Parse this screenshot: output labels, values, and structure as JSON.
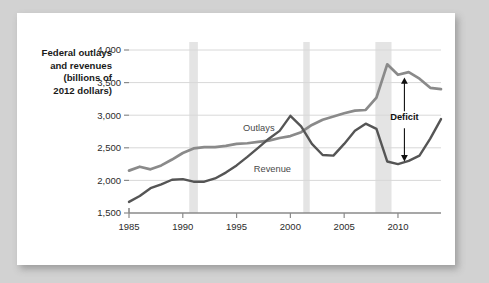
{
  "figure": {
    "y_axis_title_lines": [
      "Federal outlays",
      "and revenues",
      "(billions of",
      "2012 dollars)"
    ],
    "series_label_outlays": "Outlays",
    "series_label_revenue": "Revenue",
    "annotation_deficit": "Deficit",
    "colors": {
      "outlays_line": "#8a8a8a",
      "revenue_line": "#555555",
      "recession_band": "#e4e4e4",
      "gridline": "#d8d8d8",
      "axis": "#8a8a8a",
      "card_background": "#ffffff",
      "page_background": "#d2d2d2"
    }
  },
  "chart_data": {
    "type": "line",
    "title": "",
    "xlabel": "",
    "ylabel": "Federal outlays and revenues (billions of 2012 dollars)",
    "xlim": [
      1985,
      2014
    ],
    "ylim": [
      1500,
      4000
    ],
    "ytick_labels": [
      "1,500",
      "2,000",
      "2,500",
      "3,000",
      "3,500",
      "4,000"
    ],
    "yticks": [
      1500,
      2000,
      2500,
      3000,
      3500,
      4000
    ],
    "xtick_labels": [
      "1985",
      "1990",
      "1995",
      "2000",
      "2005",
      "2010"
    ],
    "xticks": [
      1985,
      1990,
      1995,
      2000,
      2005,
      2010
    ],
    "grid": true,
    "legend": "inline-labels",
    "x": [
      1985,
      1986,
      1987,
      1988,
      1989,
      1990,
      1991,
      1992,
      1993,
      1994,
      1995,
      1996,
      1997,
      1998,
      1999,
      2000,
      2001,
      2002,
      2003,
      2004,
      2005,
      2006,
      2007,
      2008,
      2009,
      2010,
      2011,
      2012,
      2013,
      2014
    ],
    "series": [
      {
        "name": "Outlays",
        "color": "#8a8a8a",
        "values": [
          2150,
          2210,
          2170,
          2230,
          2320,
          2420,
          2490,
          2510,
          2510,
          2530,
          2560,
          2570,
          2590,
          2610,
          2650,
          2680,
          2740,
          2850,
          2930,
          2980,
          3030,
          3070,
          3080,
          3270,
          3780,
          3620,
          3660,
          3560,
          3420,
          3400
        ]
      },
      {
        "name": "Revenue",
        "color": "#555555",
        "values": [
          1670,
          1760,
          1880,
          1940,
          2010,
          2020,
          1980,
          1980,
          2030,
          2120,
          2230,
          2360,
          2500,
          2640,
          2760,
          2990,
          2830,
          2560,
          2390,
          2380,
          2560,
          2760,
          2870,
          2790,
          2290,
          2250,
          2300,
          2380,
          2640,
          2940
        ]
      }
    ],
    "recession_bands": [
      {
        "start": 1990.6,
        "end": 1991.4
      },
      {
        "start": 2001.2,
        "end": 2001.8
      },
      {
        "start": 2007.9,
        "end": 2009.4
      }
    ],
    "annotations": [
      {
        "label": "Deficit",
        "x": 2010.6,
        "y_top": 3580,
        "y_bottom": 2290,
        "type": "double-arrow"
      }
    ]
  }
}
